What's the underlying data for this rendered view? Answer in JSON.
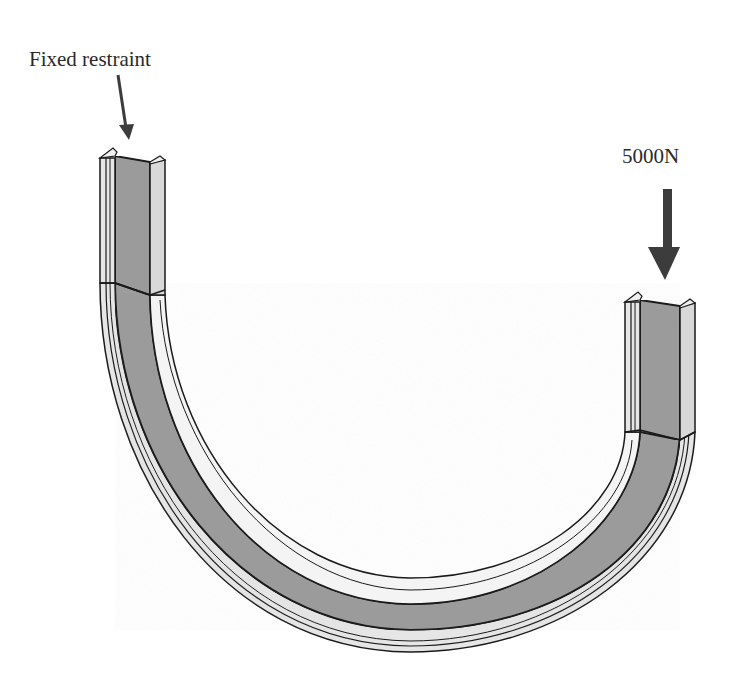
{
  "diagram": {
    "type": "structural-load-diagram",
    "labels": {
      "fixed_restraint": "Fixed restraint",
      "applied_load": "5000N"
    },
    "annotations": [
      {
        "id": "fixed-restraint-arrow",
        "target": "left beam end",
        "style": "thin arrow",
        "text": "Fixed restraint"
      },
      {
        "id": "load-arrow",
        "target": "right beam end",
        "style": "thick downward arrow",
        "text": "5000N"
      }
    ],
    "colors": {
      "background": "#ffffff",
      "web_fill": "#9c9c9c",
      "flange_fill": "#d8d8d8",
      "inner_band_fill": "#f4f4f4",
      "outline": "#1a1a1a",
      "arrow": "#3c3c3c",
      "text": "#2a2a2a"
    }
  }
}
